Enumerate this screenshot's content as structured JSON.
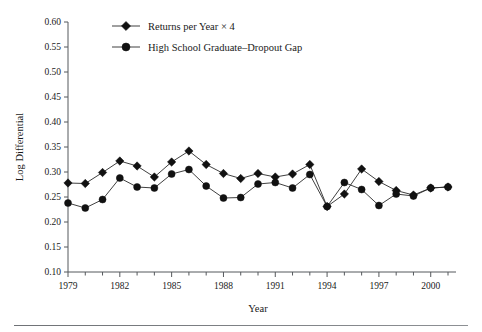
{
  "figure": {
    "background": "#ffffff",
    "ink_color": "#111111",
    "axis_color": "#55585c"
  },
  "legend": {
    "position": "top-left-inside",
    "entries": [
      {
        "label": "Returns per Year × 4",
        "marker": "diamond",
        "color": "#111111"
      },
      {
        "label": "High School Graduate–Dropout Gap",
        "marker": "circle",
        "color": "#111111"
      }
    ]
  },
  "axes": {
    "x": {
      "title": "Year",
      "min": 1979,
      "max": 2001,
      "tick_step": 1,
      "label_step": 3,
      "tick_labels": [
        "1979",
        "1982",
        "1985",
        "1988",
        "1991",
        "1994",
        "1997",
        "2000"
      ],
      "tick_label_values": [
        1979,
        1982,
        1985,
        1988,
        1991,
        1994,
        1997,
        2000
      ]
    },
    "y": {
      "title": "Log Differential",
      "min": 0.1,
      "max": 0.6,
      "tick_step": 0.05,
      "tick_labels": [
        "0.10",
        "0.15",
        "0.20",
        "0.25",
        "0.30",
        "0.35",
        "0.40",
        "0.45",
        "0.50",
        "0.55",
        "0.60"
      ],
      "tick_label_values": [
        0.1,
        0.15,
        0.2,
        0.25,
        0.3,
        0.35,
        0.4,
        0.45,
        0.5,
        0.55,
        0.6
      ]
    },
    "grid": false
  },
  "chart_data": {
    "type": "line",
    "title": "",
    "subtitle": "",
    "xlabel": "Year",
    "ylabel": "Log Differential",
    "xlim": [
      1979,
      2001
    ],
    "ylim": [
      0.1,
      0.6
    ],
    "grid": false,
    "legend_position": "top-left",
    "x": [
      1979,
      1980,
      1981,
      1982,
      1983,
      1984,
      1985,
      1986,
      1987,
      1988,
      1989,
      1990,
      1991,
      1992,
      1993,
      1994,
      1995,
      1996,
      1997,
      1998,
      1999,
      2000,
      2001
    ],
    "series": [
      {
        "name": "Returns per Year × 4",
        "marker": "diamond",
        "color": "#111111",
        "values": [
          0.278,
          0.277,
          0.299,
          0.322,
          0.312,
          0.29,
          0.32,
          0.342,
          0.315,
          0.297,
          0.287,
          0.297,
          0.29,
          0.296,
          0.315,
          0.231,
          0.256,
          0.306,
          0.281,
          0.263,
          0.254,
          0.268,
          0.27
        ]
      },
      {
        "name": "High School Graduate–Dropout Gap",
        "marker": "circle",
        "color": "#111111",
        "values": [
          0.238,
          0.228,
          0.245,
          0.288,
          0.27,
          0.268,
          0.296,
          0.305,
          0.272,
          0.248,
          0.249,
          0.276,
          0.279,
          0.268,
          0.295,
          0.231,
          0.279,
          0.265,
          0.233,
          0.256,
          0.252,
          0.268,
          0.27
        ]
      }
    ]
  }
}
